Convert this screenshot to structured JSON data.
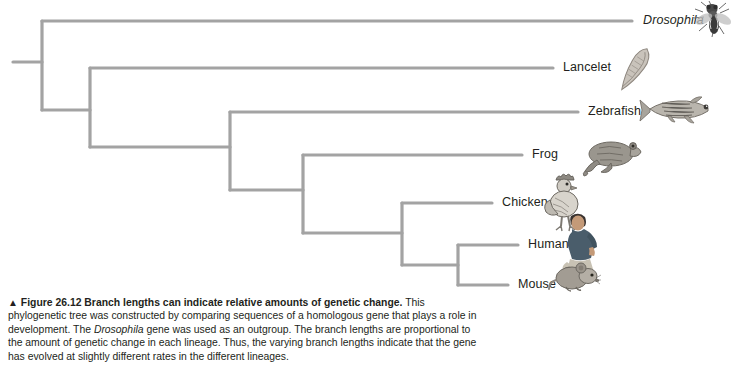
{
  "figure": {
    "marker": "▲",
    "number": "Figure 26.12",
    "headline": "Branch lengths can indicate relative amounts of genetic change.",
    "caption_part1": " This phylogenetic tree was constructed by comparing sequences of a homologous gene that plays a role in development. The ",
    "caption_italic": "Drosophila",
    "caption_part2": " gene was used as an outgroup. The branch lengths are proportional to the amount of genetic change in each lineage. Thus, the varying branch lengths indicate that the gene has evolved at slightly different rates in the different lineages."
  },
  "style": {
    "branch_color": "#a3a3a3",
    "text_color": "#231f20",
    "background": "#ffffff"
  },
  "chart_data": {
    "type": "tree",
    "title": "Branch lengths can indicate relative amounts of genetic change",
    "orientation": "left-to-right",
    "root": {
      "x": 13,
      "y": 62
    },
    "taxa": [
      {
        "name": "Drosophila",
        "italic": true,
        "tip_y": 21,
        "tip_x": 632,
        "label_x": 643,
        "parent_node": "node-1",
        "icon": "fly-icon"
      },
      {
        "name": "Lancelet",
        "italic": false,
        "tip_y": 68,
        "tip_x": 553,
        "label_x": 563,
        "parent_node": "node-2",
        "icon": "lancelet-icon"
      },
      {
        "name": "Zebrafish",
        "italic": false,
        "tip_y": 112,
        "tip_x": 578,
        "label_x": 588,
        "parent_node": "node-3",
        "icon": "zebrafish-icon"
      },
      {
        "name": "Frog",
        "italic": false,
        "tip_y": 155,
        "tip_x": 522,
        "label_x": 532,
        "parent_node": "node-4",
        "icon": "frog-icon"
      },
      {
        "name": "Chicken",
        "italic": false,
        "tip_y": 203,
        "tip_x": 492,
        "label_x": 502,
        "parent_node": "node-5",
        "icon": "chicken-icon"
      },
      {
        "name": "Human",
        "italic": false,
        "tip_y": 245,
        "tip_x": 518,
        "label_x": 528,
        "parent_node": "node-6",
        "icon": "human-icon"
      },
      {
        "name": "Mouse",
        "italic": false,
        "tip_y": 285,
        "tip_x": 508,
        "label_x": 518,
        "parent_node": "node-6",
        "icon": "mouse-icon"
      }
    ],
    "nodes": [
      {
        "id": "node-1",
        "x": 42,
        "y_top": 21,
        "y_bottom": 110,
        "label": "root-split-drosophila-vs-chordates"
      },
      {
        "id": "node-2",
        "x": 90,
        "y_top": 68,
        "y_bottom": 147,
        "label": "lancelet-vs-vertebrates"
      },
      {
        "id": "node-3",
        "x": 230,
        "y_top": 112,
        "y_bottom": 190,
        "label": "zebrafish-vs-tetrapods"
      },
      {
        "id": "node-4",
        "x": 303,
        "y_top": 155,
        "y_bottom": 233,
        "label": "frog-vs-amniotes"
      },
      {
        "id": "node-5",
        "x": 402,
        "y_top": 203,
        "y_bottom": 265,
        "label": "chicken-vs-mammals"
      },
      {
        "id": "node-6",
        "x": 458,
        "y_top": 245,
        "y_bottom": 285,
        "label": "human-vs-mouse"
      }
    ],
    "internal_branches": [
      {
        "from_x": 13,
        "to_x": 42,
        "y": 62,
        "name": "root-stub"
      },
      {
        "from_x": 42,
        "to_x": 90,
        "y": 110,
        "name": "branch-to-node-2"
      },
      {
        "from_x": 90,
        "to_x": 230,
        "y": 147,
        "name": "branch-to-node-3"
      },
      {
        "from_x": 230,
        "to_x": 303,
        "y": 190,
        "name": "branch-to-node-4"
      },
      {
        "from_x": 303,
        "to_x": 402,
        "y": 233,
        "name": "branch-to-node-5"
      },
      {
        "from_x": 402,
        "to_x": 458,
        "y": 265,
        "name": "branch-to-node-6"
      }
    ],
    "xlabel": "",
    "ylabel": "",
    "grid": false,
    "legend": "none"
  }
}
